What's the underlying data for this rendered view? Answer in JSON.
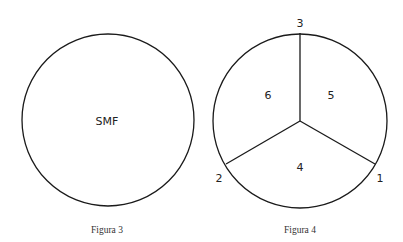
{
  "figures": [
    {
      "caption": "Figura 3",
      "center_label": "SMF",
      "circle": {
        "cx": 108,
        "cy": 120,
        "r": 86
      }
    },
    {
      "caption": "Figura 4",
      "circle": {
        "cx": 300,
        "cy": 121,
        "r": 87
      },
      "points": [
        {
          "label": "1",
          "x": 375,
          "y": 164
        },
        {
          "label": "2",
          "x": 226,
          "y": 164
        },
        {
          "label": "3",
          "x": 300,
          "y": 33
        }
      ],
      "regions": [
        {
          "label": "4"
        },
        {
          "label": "5"
        },
        {
          "label": "6"
        }
      ]
    }
  ],
  "colors": {
    "stroke": "#1a1a1a",
    "text": "#222222",
    "background": "#ffffff"
  }
}
